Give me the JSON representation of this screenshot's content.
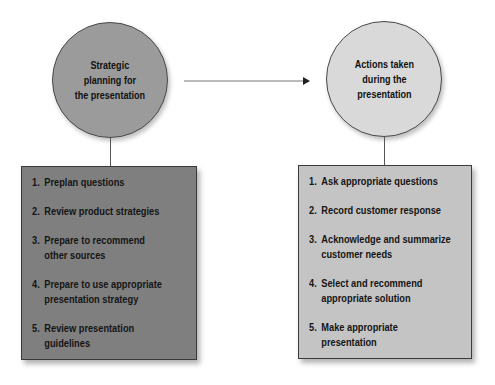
{
  "diagram": {
    "left_stage": {
      "title": "Strategic\nplanning for\nthe presentation",
      "fill": "#9b9b9b",
      "items": [
        {
          "num": "1.",
          "text": "Preplan questions"
        },
        {
          "num": "2.",
          "text": "Review product strategies"
        },
        {
          "num": "3.",
          "text": "Prepare to recommend\nother sources"
        },
        {
          "num": "4.",
          "text": "Prepare to use appropriate\npresentation strategy"
        },
        {
          "num": "5.",
          "text": "Review presentation\nguidelines"
        }
      ]
    },
    "right_stage": {
      "title": "Actions taken\nduring the\npresentation",
      "fill": "#d9d9d9",
      "items": [
        {
          "num": "1.",
          "text": " Ask appropriate questions"
        },
        {
          "num": "2.",
          "text": "Record customer response"
        },
        {
          "num": "3.",
          "text": "Acknowledge and summarize\ncustomer needs"
        },
        {
          "num": "4.",
          "text": "Select and recommend\nappropriate solution"
        },
        {
          "num": "5.",
          "text": "Make appropriate\npresentation"
        }
      ]
    },
    "connector": {
      "type": "arrow",
      "from": "left_stage",
      "to": "right_stage"
    }
  }
}
